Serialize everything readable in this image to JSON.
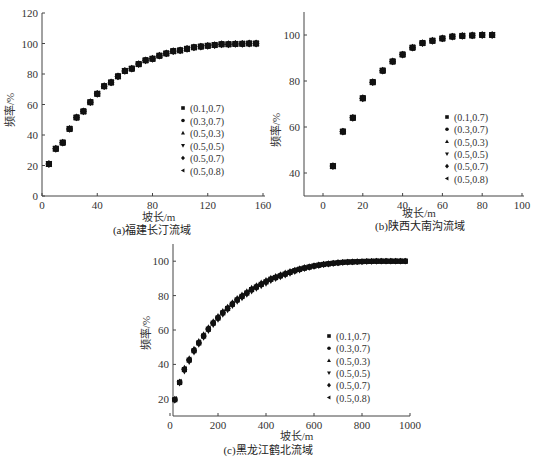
{
  "figure": {
    "legend_entries": [
      "(0.1,0.7)",
      "(0.3,0.7)",
      "(0.5,0.3)",
      "(0.5,0.5)",
      "(0.5,0.7)",
      "(0.5,0.8)"
    ],
    "legend_markers": [
      "square",
      "circle",
      "triangle-up",
      "triangle-down",
      "diamond",
      "triangle-left"
    ]
  },
  "chart_data": [
    {
      "type": "scatter",
      "title": "(a)福建长汀流域",
      "xlabel": "坡长/m",
      "ylabel": "频率/%",
      "xlim": [
        0,
        160
      ],
      "ylim": [
        0,
        120
      ],
      "xticks": [
        0,
        40,
        80,
        120,
        160
      ],
      "yticks": [
        0,
        20,
        40,
        60,
        80,
        100,
        120
      ],
      "grid": false,
      "legend_position": "right-middle",
      "x": [
        5,
        10,
        15,
        20,
        25,
        30,
        35,
        40,
        45,
        50,
        55,
        60,
        65,
        70,
        75,
        80,
        85,
        90,
        95,
        100,
        105,
        110,
        115,
        120,
        125,
        130,
        135,
        140,
        145,
        150,
        155
      ],
      "series": [
        {
          "name": "(0.1,0.7)",
          "values": [
            21,
            31,
            35,
            44,
            51.5,
            55.5,
            61.5,
            67,
            72,
            74.5,
            78.5,
            82,
            83.5,
            86.5,
            89,
            90,
            92,
            93.5,
            95,
            95.5,
            96.5,
            97.5,
            98,
            98.5,
            99,
            99.5,
            99.5,
            99.7,
            99.8,
            100,
            100
          ]
        },
        {
          "name": "(0.3,0.7)",
          "values": [
            21,
            31,
            35,
            44,
            51.5,
            55.5,
            61.5,
            67,
            72,
            74.5,
            78.5,
            82,
            83.5,
            86.5,
            89,
            90,
            92,
            93.5,
            95,
            95.5,
            96.5,
            97.5,
            98,
            98.5,
            99,
            99.5,
            99.5,
            99.7,
            99.8,
            100,
            100
          ]
        },
        {
          "name": "(0.5,0.3)",
          "values": [
            21,
            31,
            35,
            44,
            51.5,
            55.5,
            61.5,
            67,
            72,
            74.5,
            78.5,
            82,
            83.5,
            86.5,
            89,
            90,
            92,
            93.5,
            95,
            95.5,
            96.5,
            97.5,
            98,
            98.5,
            99,
            99.5,
            99.5,
            99.7,
            99.8,
            100,
            100
          ]
        },
        {
          "name": "(0.5,0.5)",
          "values": [
            21,
            31,
            35,
            44,
            51.5,
            55.5,
            61.5,
            67,
            72,
            74.5,
            78.5,
            82,
            83.5,
            86.5,
            89,
            90,
            92,
            93.5,
            95,
            95.5,
            96.5,
            97.5,
            98,
            98.5,
            99,
            99.5,
            99.5,
            99.7,
            99.8,
            100,
            100
          ]
        },
        {
          "name": "(0.5,0.7)",
          "values": [
            21,
            31,
            35,
            44,
            51.5,
            55.5,
            61.5,
            67,
            72,
            74.5,
            78.5,
            82,
            83.5,
            86.5,
            89,
            90,
            92,
            93.5,
            95,
            95.5,
            96.5,
            97.5,
            98,
            98.5,
            99,
            99.5,
            99.5,
            99.7,
            99.8,
            100,
            100
          ]
        },
        {
          "name": "(0.5,0.8)",
          "values": [
            21,
            31,
            35,
            44,
            51.5,
            55.5,
            61.5,
            67,
            72,
            74.5,
            78.5,
            82,
            83.5,
            86.5,
            89,
            90,
            92,
            93.5,
            95,
            95.5,
            96.5,
            97.5,
            98,
            98.5,
            99,
            99.5,
            99.5,
            99.7,
            99.8,
            100,
            100
          ]
        }
      ]
    },
    {
      "type": "scatter",
      "title": "(b)陕西大南沟流域",
      "xlabel": "坡长/m",
      "ylabel": "频率/%",
      "xlim": [
        -10,
        100
      ],
      "ylim": [
        30,
        110
      ],
      "xticks": [
        0,
        20,
        40,
        60,
        80,
        100
      ],
      "yticks": [
        40,
        60,
        80,
        100
      ],
      "grid": false,
      "legend_position": "right-lower",
      "x": [
        5,
        10,
        15,
        20,
        25,
        30,
        35,
        40,
        45,
        50,
        55,
        60,
        65,
        70,
        75,
        80,
        85
      ],
      "series": [
        {
          "name": "(0.1,0.7)",
          "values": [
            43,
            58,
            64,
            72.5,
            79.5,
            84.5,
            88.5,
            91.5,
            94.5,
            96.5,
            97.5,
            98.5,
            99.3,
            99.6,
            99.8,
            100,
            100
          ]
        },
        {
          "name": "(0.3,0.7)",
          "values": [
            43,
            58,
            64,
            72.5,
            79.5,
            84.5,
            88.5,
            91.5,
            94.5,
            96.5,
            97.5,
            98.5,
            99.3,
            99.6,
            99.8,
            100,
            100
          ]
        },
        {
          "name": "(0.5,0.3)",
          "values": [
            43,
            58,
            64,
            72.5,
            79.5,
            84.5,
            88.5,
            91.5,
            94.5,
            96.5,
            97.5,
            98.5,
            99.3,
            99.6,
            99.8,
            100,
            100
          ]
        },
        {
          "name": "(0.5,0.5)",
          "values": [
            43,
            58,
            64,
            72.5,
            79.5,
            84.5,
            88.5,
            91.5,
            94.5,
            96.5,
            97.5,
            98.5,
            99.3,
            99.6,
            99.8,
            100,
            100
          ]
        },
        {
          "name": "(0.5,0.7)",
          "values": [
            43,
            58,
            64,
            72.5,
            79.5,
            84.5,
            88.5,
            91.5,
            94.5,
            96.5,
            97.5,
            98.5,
            99.3,
            99.6,
            99.8,
            100,
            100
          ]
        },
        {
          "name": "(0.5,0.8)",
          "values": [
            43,
            58,
            64,
            72.5,
            79.5,
            84.5,
            88.5,
            91.5,
            94.5,
            96.5,
            97.5,
            98.5,
            99.3,
            99.6,
            99.8,
            100,
            100
          ]
        }
      ]
    },
    {
      "type": "scatter",
      "title": "(c)黑龙江鹤北流域",
      "xlabel": "坡长/m",
      "ylabel": "频率/%",
      "xlim": [
        -100,
        1100
      ],
      "ylim": [
        10,
        110
      ],
      "xticks": [
        0,
        200,
        400,
        600,
        800,
        1000
      ],
      "yticks": [
        20,
        40,
        60,
        80,
        100
      ],
      "grid": false,
      "legend_position": "right-lower",
      "x": [
        20,
        40,
        60,
        80,
        100,
        120,
        140,
        160,
        180,
        200,
        220,
        240,
        260,
        280,
        300,
        320,
        340,
        360,
        380,
        400,
        420,
        440,
        460,
        480,
        500,
        520,
        540,
        560,
        580,
        600,
        620,
        640,
        660,
        680,
        700,
        720,
        740,
        760,
        780,
        800,
        820,
        840,
        860,
        880,
        900,
        920,
        940,
        960,
        980
      ],
      "series": [
        {
          "name": "(0.1,0.7)",
          "values": [
            19.5,
            29.5,
            37,
            42.5,
            48,
            52.5,
            56.5,
            60.5,
            64,
            67,
            70,
            72.5,
            75,
            77.5,
            79.5,
            81.5,
            83.5,
            85,
            86.5,
            88,
            89.5,
            90.5,
            91.5,
            92.5,
            93.5,
            94.5,
            95.3,
            96,
            96.6,
            97.2,
            97.7,
            98.1,
            98.5,
            98.8,
            99.1,
            99.3,
            99.5,
            99.6,
            99.7,
            99.8,
            99.9,
            99.9,
            100,
            100,
            100,
            100,
            100,
            100,
            100
          ]
        },
        {
          "name": "(0.3,0.7)",
          "values": [
            19.5,
            29.5,
            37,
            42.5,
            48,
            52.5,
            56.5,
            60.5,
            64,
            67,
            70,
            72.5,
            75,
            77.5,
            79.5,
            81.5,
            83.5,
            85,
            86.5,
            88,
            89.5,
            90.5,
            91.5,
            92.5,
            93.5,
            94.5,
            95.3,
            96,
            96.6,
            97.2,
            97.7,
            98.1,
            98.5,
            98.8,
            99.1,
            99.3,
            99.5,
            99.6,
            99.7,
            99.8,
            99.9,
            99.9,
            100,
            100,
            100,
            100,
            100,
            100,
            100
          ]
        },
        {
          "name": "(0.5,0.3)",
          "values": [
            20,
            30,
            38,
            43.5,
            49,
            53.5,
            57.5,
            61.5,
            65,
            68,
            71,
            73.5,
            76,
            78.5,
            80.5,
            82.5,
            84.5,
            86,
            87.5,
            89,
            90.3,
            91.3,
            92.3,
            93.3,
            94.2,
            95,
            95.8,
            96.5,
            97,
            97.6,
            98,
            98.4,
            98.7,
            99,
            99.3,
            99.5,
            99.6,
            99.7,
            99.8,
            99.9,
            99.9,
            100,
            100,
            100,
            100,
            100,
            100,
            100,
            100
          ]
        },
        {
          "name": "(0.5,0.5)",
          "values": [
            19,
            29,
            36,
            41.5,
            47,
            51.5,
            55.5,
            59.5,
            63,
            66,
            69,
            71.5,
            74,
            76.5,
            78.5,
            80.5,
            82.5,
            84,
            85.5,
            87,
            88.5,
            89.7,
            90.8,
            91.8,
            92.8,
            93.8,
            94.7,
            95.5,
            96.2,
            96.8,
            97.3,
            97.8,
            98.2,
            98.6,
            98.9,
            99.1,
            99.3,
            99.5,
            99.6,
            99.7,
            99.8,
            99.9,
            99.9,
            100,
            100,
            100,
            100,
            100,
            100
          ]
        },
        {
          "name": "(0.5,0.7)",
          "values": [
            19.5,
            29.5,
            37,
            42.5,
            48,
            52.5,
            56.5,
            60.5,
            64,
            67,
            70,
            72.5,
            75,
            77.5,
            79.5,
            81.5,
            83.5,
            85,
            86.5,
            88,
            89.5,
            90.5,
            91.5,
            92.5,
            93.5,
            94.5,
            95.3,
            96,
            96.6,
            97.2,
            97.7,
            98.1,
            98.5,
            98.8,
            99.1,
            99.3,
            99.5,
            99.6,
            99.7,
            99.8,
            99.9,
            99.9,
            100,
            100,
            100,
            100,
            100,
            100,
            100
          ]
        },
        {
          "name": "(0.5,0.8)",
          "values": [
            20,
            30,
            37.5,
            43,
            48.5,
            53,
            57,
            61,
            64.5,
            67.5,
            70.5,
            73,
            75.5,
            78,
            80,
            82,
            84,
            85.5,
            87,
            88.5,
            90,
            91,
            92,
            93,
            94,
            95,
            95.7,
            96.3,
            96.9,
            97.4,
            97.9,
            98.3,
            98.6,
            98.9,
            99.2,
            99.4,
            99.6,
            99.7,
            99.8,
            99.9,
            99.9,
            100,
            100,
            100,
            100,
            100,
            100,
            100,
            100
          ]
        }
      ]
    }
  ]
}
